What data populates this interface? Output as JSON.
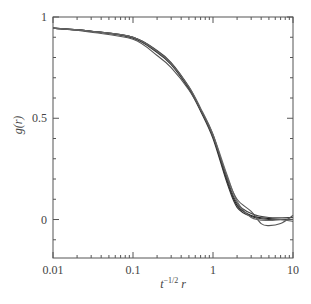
{
  "chart_data": {
    "type": "line",
    "title": "",
    "xlabel": "t^{-1/2} r",
    "ylabel": "g(r)",
    "xscale": "log",
    "xlim": [
      0.01,
      10
    ],
    "ylim": [
      -0.19,
      1
    ],
    "x_ticks": [
      0.01,
      0.1,
      1,
      10
    ],
    "x_tick_labels": [
      "0.01",
      "0.1",
      "1",
      "10"
    ],
    "y_ticks": [
      0,
      0.5,
      1
    ],
    "y_tick_labels": [
      "0",
      "0.5",
      "1"
    ],
    "grid": false,
    "legend": null,
    "series": [
      {
        "name": "curve-1",
        "color": "#222222",
        "x": [
          0.01,
          0.03,
          0.1,
          0.2,
          0.3,
          0.5,
          0.7,
          1,
          1.5,
          2,
          3,
          5,
          10
        ],
        "y": [
          0.945,
          0.93,
          0.9,
          0.83,
          0.77,
          0.65,
          0.54,
          0.41,
          0.19,
          0.07,
          0.02,
          0.005,
          0.0
        ]
      },
      {
        "name": "curve-2",
        "color": "#333333",
        "x": [
          0.01,
          0.03,
          0.1,
          0.2,
          0.3,
          0.5,
          0.7,
          1,
          1.5,
          2,
          3,
          5,
          10
        ],
        "y": [
          0.945,
          0.93,
          0.895,
          0.825,
          0.765,
          0.645,
          0.535,
          0.4,
          0.18,
          0.06,
          0.015,
          0.0,
          0.0
        ]
      },
      {
        "name": "curve-3",
        "color": "#444444",
        "x": [
          0.01,
          0.03,
          0.1,
          0.2,
          0.3,
          0.5,
          0.7,
          1,
          1.5,
          2,
          3,
          5,
          10
        ],
        "y": [
          0.945,
          0.93,
          0.9,
          0.835,
          0.775,
          0.655,
          0.545,
          0.42,
          0.2,
          0.08,
          0.03,
          0.01,
          0.01
        ]
      },
      {
        "name": "curve-4",
        "color": "#555555",
        "x": [
          0.01,
          0.03,
          0.1,
          0.2,
          0.3,
          0.5,
          0.7,
          1,
          1.5,
          2,
          3,
          4,
          5,
          7,
          10
        ],
        "y": [
          0.945,
          0.925,
          0.89,
          0.81,
          0.75,
          0.64,
          0.54,
          0.41,
          0.21,
          0.1,
          0.04,
          -0.02,
          -0.03,
          -0.02,
          0.02
        ]
      },
      {
        "name": "curve-5",
        "color": "#666666",
        "x": [
          0.01,
          0.03,
          0.1,
          0.2,
          0.3,
          0.5,
          0.7,
          1,
          1.5,
          2,
          3,
          5,
          7,
          10
        ],
        "y": [
          0.945,
          0.93,
          0.9,
          0.83,
          0.77,
          0.655,
          0.55,
          0.42,
          0.22,
          0.09,
          0.01,
          -0.005,
          0.0,
          -0.01
        ]
      }
    ]
  }
}
